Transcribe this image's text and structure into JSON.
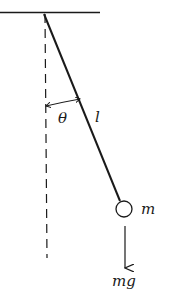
{
  "diagram": {
    "type": "simple-pendulum",
    "labels": {
      "angle": "θ",
      "length": "l",
      "mass": "m",
      "force": "mg"
    },
    "colors": {
      "ink": "#1a1a1a",
      "background": "#ffffff"
    }
  }
}
